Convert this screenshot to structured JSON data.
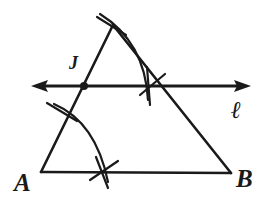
{
  "figure": {
    "background_color": "#ffffff",
    "ink_color": "#1a1a1a",
    "width": 262,
    "height": 202
  },
  "labels": {
    "vertex_a": "A",
    "vertex_b": "B",
    "point_j": "J",
    "line_l": "ℓ"
  },
  "points": {
    "a": {
      "name": "A",
      "x": 41,
      "y": 172
    },
    "b": {
      "name": "B",
      "x": 231,
      "y": 173
    },
    "apex": {
      "name": "C",
      "x": 113,
      "y": 25
    },
    "j": {
      "name": "J",
      "x": 84,
      "y": 86,
      "marked": true
    },
    "ray_left_end": {
      "x": 32,
      "y": 86
    },
    "ray_right_end": {
      "x": 250,
      "y": 86
    },
    "arc_cross_right": {
      "x": 152,
      "y": 86
    },
    "arc_cross_left_side": {
      "x": 60,
      "y": 112
    },
    "arc_cross_base": {
      "x": 103,
      "y": 172
    }
  },
  "segments": [
    {
      "name": "side-AC",
      "from": "a",
      "to": "apex"
    },
    {
      "name": "side-CB",
      "from": "apex",
      "to": "b"
    },
    {
      "name": "base-AB",
      "from": "a",
      "to": "b"
    }
  ],
  "line_l": {
    "name": "line-l",
    "label": "ℓ",
    "double_arrow": true,
    "passes_through": [
      "J"
    ],
    "y": 86
  },
  "construction_arcs": [
    {
      "name": "arc-centered-at-A",
      "description": "large arc from side AC to base AB"
    },
    {
      "name": "arc-centered-at-J",
      "description": "arc from apex region crossing line l"
    },
    {
      "name": "tick-on-AC",
      "description": "short arc tick crossing side AC"
    },
    {
      "name": "tick-on-AB",
      "description": "short cross tick on base AB"
    },
    {
      "name": "tick-at-apex",
      "description": "short cross tick at apex C"
    },
    {
      "name": "tick-on-line-l",
      "description": "short cross tick where arc meets line l"
    }
  ]
}
